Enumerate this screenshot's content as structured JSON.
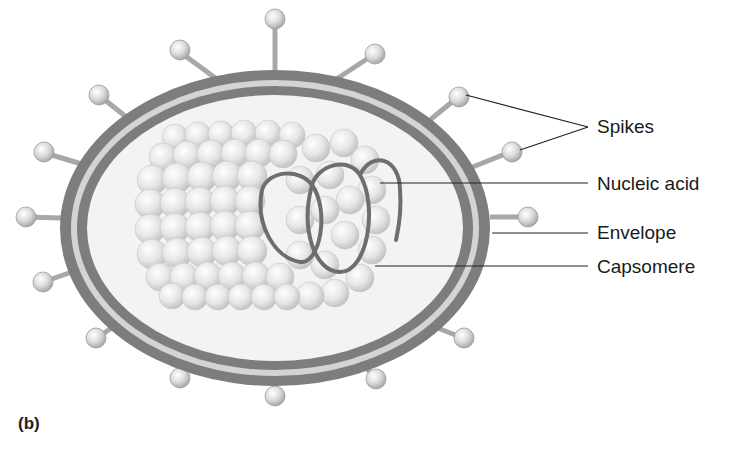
{
  "figure": {
    "panel_label": "(b)",
    "labels": [
      {
        "id": "spikes",
        "text": "Spikes",
        "x": 597,
        "y": 114
      },
      {
        "id": "nucleic-acid",
        "text": "Nucleic acid",
        "x": 597,
        "y": 173
      },
      {
        "id": "envelope",
        "text": "Envelope",
        "x": 597,
        "y": 221
      },
      {
        "id": "capsomere",
        "text": "Capsomere",
        "x": 597,
        "y": 255
      }
    ]
  },
  "colors": {
    "envelope_dark": "#7d7d7d",
    "envelope_light": "#d4d4d4",
    "interior": "#f3f3f3",
    "capsomere": "#e2e2e2",
    "nucleic_acid": "#6e6e6e",
    "spike_stalk": "#a8a8a8",
    "spike_head": "#d0d0d0",
    "leader_line": "#222222"
  }
}
